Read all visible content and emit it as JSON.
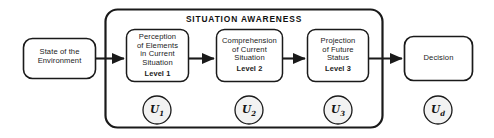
{
  "diagram": {
    "title": "SITUATION AWARENESS",
    "container": {
      "name": "situation-awareness-container"
    },
    "nodes": [
      {
        "id": "state-of-environment",
        "lines": [
          "State of the",
          "Environment"
        ],
        "level": "",
        "utility": "U",
        "utility_sub": "",
        "shape": "rounded-rect",
        "inside_container": false
      },
      {
        "id": "perception",
        "lines": [
          "Perception",
          "of Elements",
          "in Current",
          "Situation"
        ],
        "level": "Level 1",
        "utility": "U",
        "utility_sub": "1",
        "shape": "rounded-rect",
        "inside_container": true
      },
      {
        "id": "comprehension",
        "lines": [
          "Comprehension",
          "of Current",
          "Situation"
        ],
        "level": "Level 2",
        "utility": "U",
        "utility_sub": "2",
        "shape": "rounded-rect",
        "inside_container": true
      },
      {
        "id": "projection",
        "lines": [
          "Projection",
          "of Future",
          "Status"
        ],
        "level": "Level 3",
        "utility": "U",
        "utility_sub": "3",
        "shape": "rounded-rect",
        "inside_container": true
      },
      {
        "id": "decision",
        "lines": [
          "Decision"
        ],
        "level": "",
        "utility": "U",
        "utility_sub": "d",
        "shape": "rounded-rect",
        "inside_container": false
      }
    ],
    "edges": [
      {
        "from": "state-of-environment",
        "to": "perception",
        "style": "solid-arrow"
      },
      {
        "from": "perception",
        "to": "comprehension",
        "style": "solid-arrow"
      },
      {
        "from": "comprehension",
        "to": "projection",
        "style": "solid-arrow"
      },
      {
        "from": "projection",
        "to": "decision",
        "style": "solid-arrow"
      }
    ],
    "colors": {
      "stroke": "#1a1a1a",
      "node_fill": "#ffffff",
      "circle_fill": "#f2f2f2",
      "background": "#ffffff",
      "text": "#1a1a1a"
    }
  }
}
